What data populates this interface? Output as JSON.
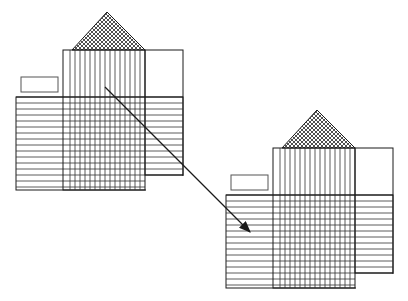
{
  "diagram": {
    "type": "transformation-illustration",
    "figures": [
      {
        "id": "figure-source",
        "origin": [
          0,
          0
        ],
        "parts": [
          "cross-hatched roof triangle",
          "vertically striped column",
          "right empty box",
          "horizontally striped band",
          "small empty rectangle"
        ]
      },
      {
        "id": "figure-target",
        "origin": [
          210,
          98
        ],
        "parts": [
          "cross-hatched roof triangle",
          "vertically striped column",
          "right empty box",
          "horizontally striped band",
          "small empty rectangle"
        ]
      }
    ],
    "arrow": {
      "from": [
        105,
        87
      ],
      "to": [
        212,
        193
      ]
    },
    "colors": {
      "stroke": "#1a1a1a",
      "background": "#ffffff"
    }
  }
}
